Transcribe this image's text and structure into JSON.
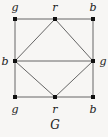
{
  "figure": {
    "caption": "G",
    "caption_x": 55,
    "caption_y": 125,
    "background_color": "#f7f6f4",
    "edge_color": "#555555",
    "vertex_color": "#111111",
    "text_color": "#1b1b1b",
    "width": 108,
    "height": 137
  },
  "chart_data": {
    "type": "diagram",
    "title": "G",
    "nodes": [
      {
        "id": "tl",
        "label": "g",
        "x": 15,
        "y": 19,
        "label_x": 15,
        "label_y": 7
      },
      {
        "id": "tm",
        "label": "r",
        "x": 55,
        "y": 19,
        "label_x": 55,
        "label_y": 7
      },
      {
        "id": "tr",
        "label": "b",
        "x": 93,
        "y": 19,
        "label_x": 93,
        "label_y": 7
      },
      {
        "id": "ml",
        "label": "b",
        "x": 15,
        "y": 61,
        "label_x": 5,
        "label_y": 61
      },
      {
        "id": "mr",
        "label": "g",
        "x": 93,
        "y": 61,
        "label_x": 103,
        "label_y": 61
      },
      {
        "id": "bl",
        "label": "g",
        "x": 15,
        "y": 97,
        "label_x": 15,
        "label_y": 109
      },
      {
        "id": "bm",
        "label": "r",
        "x": 55,
        "y": 97,
        "label_x": 55,
        "label_y": 109
      },
      {
        "id": "br",
        "label": "b",
        "x": 93,
        "y": 97,
        "label_x": 93,
        "label_y": 109
      }
    ],
    "edges": [
      {
        "from": "tl",
        "to": "tm"
      },
      {
        "from": "tm",
        "to": "tr"
      },
      {
        "from": "tl",
        "to": "ml"
      },
      {
        "from": "ml",
        "to": "bl"
      },
      {
        "from": "tr",
        "to": "mr"
      },
      {
        "from": "mr",
        "to": "br"
      },
      {
        "from": "bl",
        "to": "bm"
      },
      {
        "from": "bm",
        "to": "br"
      },
      {
        "from": "tm",
        "to": "ml"
      },
      {
        "from": "tm",
        "to": "mr"
      },
      {
        "from": "ml",
        "to": "bm"
      },
      {
        "from": "mr",
        "to": "bm"
      },
      {
        "from": "ml",
        "to": "mr"
      }
    ],
    "legend": [
      {
        "key": "g",
        "meaning": "green"
      },
      {
        "key": "r",
        "meaning": "red"
      },
      {
        "key": "b",
        "meaning": "blue"
      }
    ]
  }
}
